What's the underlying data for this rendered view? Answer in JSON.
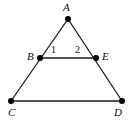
{
  "figure": {
    "background_color": "#ffffff",
    "stroke_color": "#1a1a1a",
    "vertex_color": "#000000",
    "stroke_width": 1.3,
    "vertex_radius": 3.0,
    "width": 131,
    "height": 125,
    "points": {
      "A": {
        "x": 68,
        "y": 19
      },
      "B": {
        "x": 40,
        "y": 58
      },
      "E": {
        "x": 96,
        "y": 58
      },
      "C": {
        "x": 11,
        "y": 101
      },
      "D": {
        "x": 122,
        "y": 101
      }
    },
    "segments": [
      {
        "name": "AC",
        "from": "A",
        "to": "C"
      },
      {
        "name": "AD",
        "from": "A",
        "to": "D"
      },
      {
        "name": "BE",
        "from": "B",
        "to": "E"
      },
      {
        "name": "CD",
        "from": "C",
        "to": "D"
      }
    ],
    "vertex_labels": [
      {
        "key": "A",
        "text": "A",
        "x": 63,
        "y": 2
      },
      {
        "key": "B",
        "text": "B",
        "x": 27,
        "y": 51
      },
      {
        "key": "E",
        "text": "E",
        "x": 102,
        "y": 51
      },
      {
        "key": "C",
        "text": "C",
        "x": 8,
        "y": 107
      },
      {
        "key": "D",
        "text": "D",
        "x": 114,
        "y": 107
      }
    ],
    "angle_labels": [
      {
        "key": "angle-1",
        "text": "1",
        "x": 51,
        "y": 45
      },
      {
        "key": "angle-2",
        "text": "2",
        "x": 75,
        "y": 45
      }
    ]
  }
}
